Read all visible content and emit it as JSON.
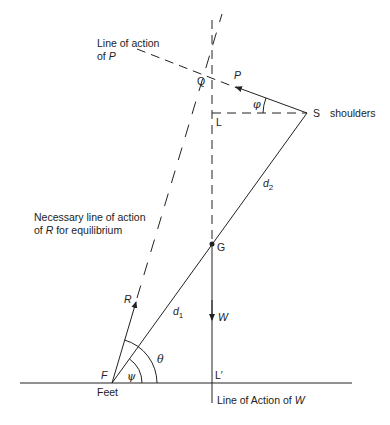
{
  "diagram": {
    "type": "free-body force diagram",
    "colors": {
      "ink": "#222222",
      "background": "#ffffff"
    },
    "points": {
      "Q": "Q",
      "L": "L",
      "S": "S",
      "S_desc": "shoulders",
      "G": "G",
      "F": "F",
      "F_desc": "Feet",
      "L_prime": "L′"
    },
    "forces": {
      "P": "P",
      "R": "R",
      "W": "W"
    },
    "distances": {
      "d1": "d",
      "d1_sub": "1",
      "d2": "d",
      "d2_sub": "2"
    },
    "angles": {
      "phi": "φ",
      "theta": "θ",
      "psi": "ψ"
    },
    "annotations": {
      "line_of_action_P_1": "Line of action",
      "line_of_action_P_2_prefix": "of ",
      "line_of_action_P_2_sym": "P",
      "line_R_1": "Necessary line of action",
      "line_R_2_prefix": "of ",
      "line_R_2_sym": "R",
      "line_R_2_suffix": " for equilibrium",
      "line_W_prefix": "Line of Action of ",
      "line_W_sym": "W"
    }
  }
}
